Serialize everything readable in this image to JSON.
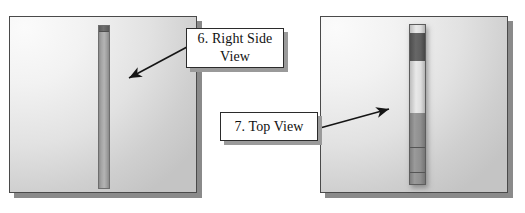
{
  "figure": {
    "background_color": "#ffffff",
    "panels": [
      {
        "name": "right-side-view-panel",
        "bar": {
          "name": "right-side-view-bar",
          "cap": "dark-top-cap"
        }
      },
      {
        "name": "top-view-panel",
        "bar": {
          "name": "top-view-bar",
          "segments": [
            "light-cap",
            "dark-band",
            "light-body",
            "mid-body",
            "lower-band",
            "bottom-cap"
          ]
        }
      }
    ],
    "callouts": [
      {
        "id": "callout-6",
        "label": "6. Right Side View",
        "line1": "6. Right Side",
        "line2": "View",
        "text_color": "#111111",
        "box_color": "#ffffff",
        "border_color": "#2b2b2b"
      },
      {
        "id": "callout-7",
        "label": "7. Top View",
        "line1": "7. Top View",
        "line2": "",
        "text_color": "#111111",
        "box_color": "#ffffff",
        "border_color": "#2b2b2b"
      }
    ],
    "arrows": [
      {
        "id": "arrow-to-right-side-view",
        "from": "callout-6",
        "direction": "down-left",
        "color": "#1a1a1a"
      },
      {
        "id": "arrow-to-top-view",
        "from": "callout-7",
        "direction": "up-right",
        "color": "#1a1a1a"
      }
    ]
  }
}
